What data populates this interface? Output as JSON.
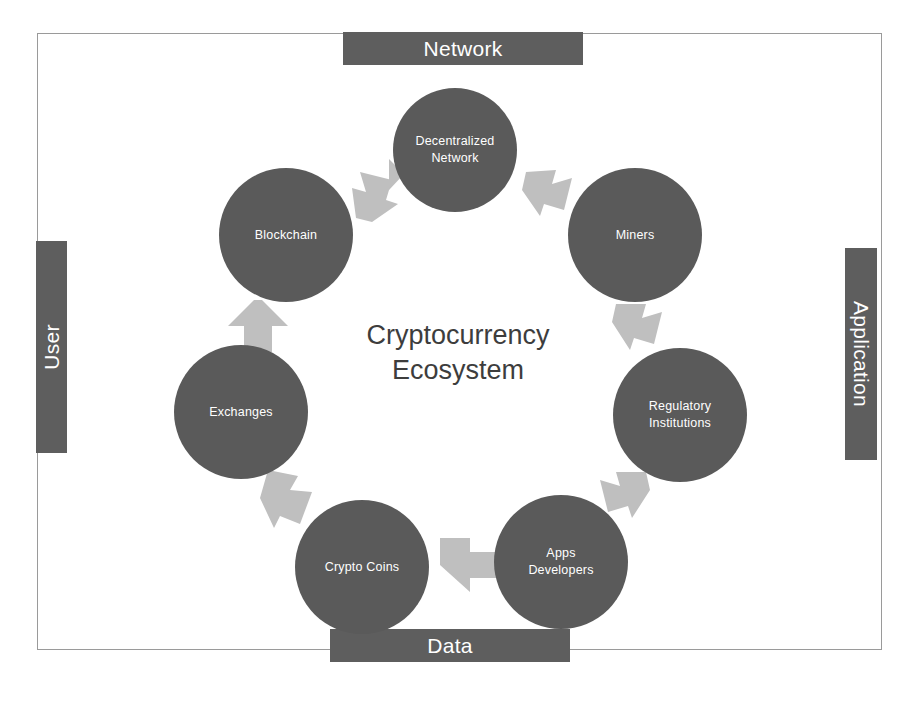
{
  "diagram": {
    "title": "Cryptocurrency Ecosystem",
    "center_title_line1": "Cryptocurrency",
    "center_title_line2": "Ecosystem",
    "center_title_text": "Cryptocurrency\nEcosystem",
    "colors": {
      "node_fill": "#5a5a5a",
      "bar_fill": "#5e5e5e",
      "arrow_fill": "#bfbfbf",
      "frame_border": "#9a9a9a",
      "node_text": "#ffffff",
      "title_text": "#3d3d3d",
      "background": "#ffffff"
    }
  },
  "edge_labels": {
    "top": "Network",
    "right": "Application",
    "bottom": "Data",
    "left": "User"
  },
  "nodes": [
    {
      "id": "decentralized-network",
      "label": "Decentralized\nNetwork",
      "position": "top"
    },
    {
      "id": "miners",
      "label": "Miners",
      "position": "top-right"
    },
    {
      "id": "regulatory-institutions",
      "label": "Regulatory\nInstitutions",
      "position": "right"
    },
    {
      "id": "apps-developers",
      "label": "Apps\nDevelopers",
      "position": "bottom-right"
    },
    {
      "id": "crypto-coins",
      "label": "Crypto Coins",
      "position": "bottom-left"
    },
    {
      "id": "exchanges",
      "label": "Exchanges",
      "position": "left"
    },
    {
      "id": "blockchain",
      "label": "Blockchain",
      "position": "top-left"
    }
  ],
  "arrows": [
    {
      "id": "arrow-blockchain-to-decentralized",
      "from": "blockchain",
      "to": "decentralized-network",
      "direction": "up-right"
    },
    {
      "id": "arrow-decentralized-to-miners",
      "from": "decentralized-network",
      "to": "miners",
      "direction": "down-right"
    },
    {
      "id": "arrow-miners-to-regulatory",
      "from": "miners",
      "to": "regulatory-institutions",
      "direction": "down-right"
    },
    {
      "id": "arrow-regulatory-to-apps",
      "from": "regulatory-institutions",
      "to": "apps-developers",
      "direction": "down-left"
    },
    {
      "id": "arrow-apps-to-crypto",
      "from": "apps-developers",
      "to": "crypto-coins",
      "direction": "left"
    },
    {
      "id": "arrow-crypto-to-exchanges",
      "from": "crypto-coins",
      "to": "exchanges",
      "direction": "up-left"
    },
    {
      "id": "arrow-exchanges-to-blockchain",
      "from": "exchanges",
      "to": "blockchain",
      "direction": "up"
    }
  ]
}
